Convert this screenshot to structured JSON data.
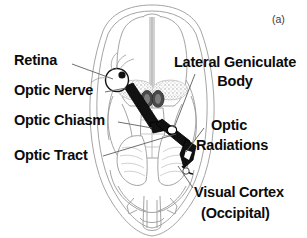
{
  "figure": {
    "panel_tag": "(a)",
    "caption_subject": "Human visual pathway, inferior view of brain",
    "background_color": "#ffffff",
    "ink_color": "#0b0b0b",
    "outline_color": "#8a8a8a",
    "tract_color": "#111111",
    "shading_color": "#a9a9a9"
  },
  "labels": {
    "retina": "Retina",
    "optic_nerve": "Optic Nerve",
    "optic_chiasm": "Optic Chiasm",
    "optic_tract": "Optic Tract",
    "lateral_geniculate_body_line1": "Lateral Geniculate",
    "lateral_geniculate_body_line2": "Body",
    "optic_radiations_line1": "Optic",
    "optic_radiations_line2": "Radiations",
    "visual_cortex_line1": "Visual Cortex",
    "visual_cortex_line2": "(Occipital)"
  },
  "structures": [
    {
      "name": "retina",
      "label": "Retina",
      "side": "left"
    },
    {
      "name": "optic-nerve",
      "label": "Optic Nerve",
      "side": "left"
    },
    {
      "name": "optic-chiasm",
      "label": "Optic Chiasm",
      "side": "left"
    },
    {
      "name": "optic-tract",
      "label": "Optic Tract",
      "side": "left"
    },
    {
      "name": "lateral-geniculate-body",
      "label": "Lateral Geniculate Body",
      "side": "right"
    },
    {
      "name": "optic-radiations",
      "label": "Optic Radiations",
      "side": "right"
    },
    {
      "name": "visual-cortex",
      "label": "Visual Cortex (Occipital)",
      "side": "right"
    }
  ]
}
